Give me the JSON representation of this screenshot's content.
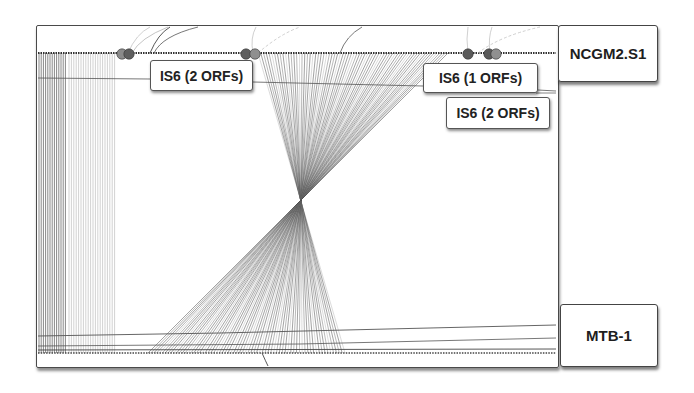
{
  "genomes": {
    "top": {
      "name": "NCGM2.S1"
    },
    "bottom": {
      "name": "MTB-1"
    }
  },
  "is_labels": [
    {
      "text": "IS6 (2 ORFs)"
    },
    {
      "text": "IS6 (1 ORFs)"
    },
    {
      "text": "IS6 (2 ORFs)"
    }
  ],
  "markers": [
    {
      "x": 122,
      "color": "#8a8a8a"
    },
    {
      "x": 129,
      "color": "#5e5e5e"
    },
    {
      "x": 246,
      "color": "#5e5e5e"
    },
    {
      "x": 255,
      "color": "#8f8f8f"
    },
    {
      "x": 468,
      "color": "#5a5a5a"
    },
    {
      "x": 489,
      "color": "#5a5a5a"
    },
    {
      "x": 496,
      "color": "#909090"
    }
  ],
  "colors": {
    "line_dark": "#3a3a3a",
    "line_mid": "#6a6a6a",
    "line_light": "#b4b4b4",
    "frame": "#4a4a4a"
  },
  "layout": {
    "top_track_y": 53,
    "bottom_track_y": 353,
    "cross_x": 302,
    "cross_y": 205,
    "top_fan": [
      258,
      448
    ],
    "bottom_fan": [
      148,
      345
    ]
  }
}
